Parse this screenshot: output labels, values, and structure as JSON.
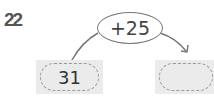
{
  "problem": {
    "number": "22",
    "operation": "+25",
    "start_value": "31",
    "answer_value": ""
  },
  "colors": {
    "box_fill": "#ebebeb",
    "dash": "#999999",
    "line": "#777777",
    "number": "#555555"
  }
}
